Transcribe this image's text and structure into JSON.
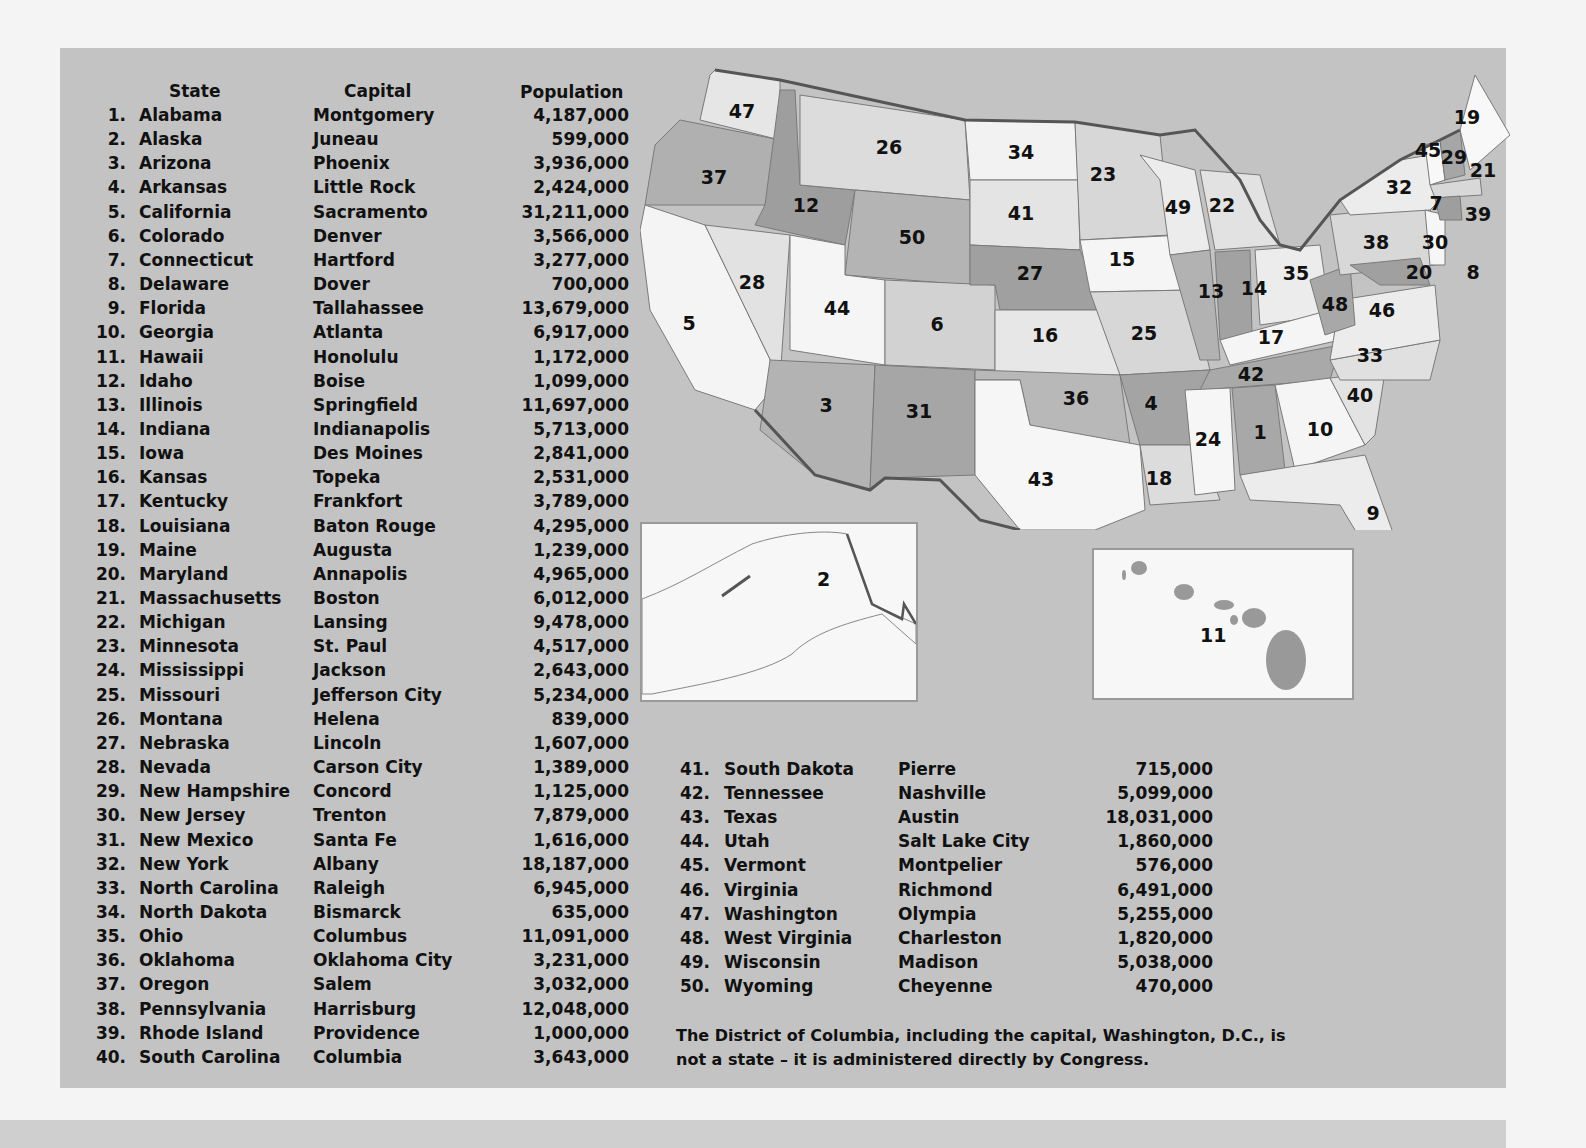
{
  "headers": {
    "state": "State",
    "capital": "Capital",
    "population": "Population"
  },
  "states": [
    {
      "n": "1.",
      "state": "Alabama",
      "capital": "Montgomery",
      "pop": "4,187,000"
    },
    {
      "n": "2.",
      "state": "Alaska",
      "capital": "Juneau",
      "pop": "599,000"
    },
    {
      "n": "3.",
      "state": "Arizona",
      "capital": "Phoenix",
      "pop": "3,936,000"
    },
    {
      "n": "4.",
      "state": "Arkansas",
      "capital": "Little Rock",
      "pop": "2,424,000"
    },
    {
      "n": "5.",
      "state": "California",
      "capital": "Sacramento",
      "pop": "31,211,000"
    },
    {
      "n": "6.",
      "state": "Colorado",
      "capital": "Denver",
      "pop": "3,566,000"
    },
    {
      "n": "7.",
      "state": "Connecticut",
      "capital": "Hartford",
      "pop": "3,277,000"
    },
    {
      "n": "8.",
      "state": "Delaware",
      "capital": "Dover",
      "pop": "700,000"
    },
    {
      "n": "9.",
      "state": "Florida",
      "capital": "Tallahassee",
      "pop": "13,679,000"
    },
    {
      "n": "10.",
      "state": "Georgia",
      "capital": "Atlanta",
      "pop": "6,917,000"
    },
    {
      "n": "11.",
      "state": "Hawaii",
      "capital": "Honolulu",
      "pop": "1,172,000"
    },
    {
      "n": "12.",
      "state": "Idaho",
      "capital": "Boise",
      "pop": "1,099,000"
    },
    {
      "n": "13.",
      "state": "Illinois",
      "capital": "Springfield",
      "pop": "11,697,000"
    },
    {
      "n": "14.",
      "state": "Indiana",
      "capital": "Indianapolis",
      "pop": "5,713,000"
    },
    {
      "n": "15.",
      "state": "Iowa",
      "capital": "Des Moines",
      "pop": "2,841,000"
    },
    {
      "n": "16.",
      "state": "Kansas",
      "capital": "Topeka",
      "pop": "2,531,000"
    },
    {
      "n": "17.",
      "state": "Kentucky",
      "capital": "Frankfort",
      "pop": "3,789,000"
    },
    {
      "n": "18.",
      "state": "Louisiana",
      "capital": "Baton Rouge",
      "pop": "4,295,000"
    },
    {
      "n": "19.",
      "state": "Maine",
      "capital": "Augusta",
      "pop": "1,239,000"
    },
    {
      "n": "20.",
      "state": "Maryland",
      "capital": "Annapolis",
      "pop": "4,965,000"
    },
    {
      "n": "21.",
      "state": "Massachusetts",
      "capital": "Boston",
      "pop": "6,012,000"
    },
    {
      "n": "22.",
      "state": "Michigan",
      "capital": "Lansing",
      "pop": "9,478,000"
    },
    {
      "n": "23.",
      "state": "Minnesota",
      "capital": "St. Paul",
      "pop": "4,517,000"
    },
    {
      "n": "24.",
      "state": "Mississippi",
      "capital": "Jackson",
      "pop": "2,643,000"
    },
    {
      "n": "25.",
      "state": "Missouri",
      "capital": "Jefferson City",
      "pop": "5,234,000"
    },
    {
      "n": "26.",
      "state": "Montana",
      "capital": "Helena",
      "pop": "839,000"
    },
    {
      "n": "27.",
      "state": "Nebraska",
      "capital": "Lincoln",
      "pop": "1,607,000"
    },
    {
      "n": "28.",
      "state": "Nevada",
      "capital": "Carson City",
      "pop": "1,389,000"
    },
    {
      "n": "29.",
      "state": "New Hampshire",
      "capital": "Concord",
      "pop": "1,125,000"
    },
    {
      "n": "30.",
      "state": "New Jersey",
      "capital": "Trenton",
      "pop": "7,879,000"
    },
    {
      "n": "31.",
      "state": "New Mexico",
      "capital": "Santa Fe",
      "pop": "1,616,000"
    },
    {
      "n": "32.",
      "state": "New York",
      "capital": "Albany",
      "pop": "18,187,000"
    },
    {
      "n": "33.",
      "state": "North Carolina",
      "capital": "Raleigh",
      "pop": "6,945,000"
    },
    {
      "n": "34.",
      "state": "North Dakota",
      "capital": "Bismarck",
      "pop": "635,000"
    },
    {
      "n": "35.",
      "state": "Ohio",
      "capital": "Columbus",
      "pop": "11,091,000"
    },
    {
      "n": "36.",
      "state": "Oklahoma",
      "capital": "Oklahoma City",
      "pop": "3,231,000"
    },
    {
      "n": "37.",
      "state": "Oregon",
      "capital": "Salem",
      "pop": "3,032,000"
    },
    {
      "n": "38.",
      "state": "Pennsylvania",
      "capital": "Harrisburg",
      "pop": "12,048,000"
    },
    {
      "n": "39.",
      "state": "Rhode Island",
      "capital": "Providence",
      "pop": "1,000,000"
    },
    {
      "n": "40.",
      "state": "South Carolina",
      "capital": "Columbia",
      "pop": "3,643,000"
    },
    {
      "n": "41.",
      "state": "South Dakota",
      "capital": "Pierre",
      "pop": "715,000"
    },
    {
      "n": "42.",
      "state": "Tennessee",
      "capital": "Nashville",
      "pop": "5,099,000"
    },
    {
      "n": "43.",
      "state": "Texas",
      "capital": "Austin",
      "pop": "18,031,000"
    },
    {
      "n": "44.",
      "state": "Utah",
      "capital": "Salt Lake City",
      "pop": "1,860,000"
    },
    {
      "n": "45.",
      "state": "Vermont",
      "capital": "Montpelier",
      "pop": "576,000"
    },
    {
      "n": "46.",
      "state": "Virginia",
      "capital": "Richmond",
      "pop": "6,491,000"
    },
    {
      "n": "47.",
      "state": "Washington",
      "capital": "Olympia",
      "pop": "5,255,000"
    },
    {
      "n": "48.",
      "state": "West Virginia",
      "capital": "Charleston",
      "pop": "1,820,000"
    },
    {
      "n": "49.",
      "state": "Wisconsin",
      "capital": "Madison",
      "pop": "5,038,000"
    },
    {
      "n": "50.",
      "state": "Wyoming",
      "capital": "Cheyenne",
      "pop": "470,000"
    }
  ],
  "note": "The District of Columbia, including the capital, Washington, D.C., is not a state – it is administered directly by Congress.",
  "map": {
    "colors": {
      "light": "#f4f4f4",
      "mid": "#d9d9d9",
      "dark": "#a8a8a8",
      "border": "#555555"
    },
    "labels": [
      {
        "id": "47",
        "x": 102,
        "y": 58
      },
      {
        "id": "37",
        "x": 74,
        "y": 124
      },
      {
        "id": "12",
        "x": 166,
        "y": 152
      },
      {
        "id": "26",
        "x": 249,
        "y": 94
      },
      {
        "id": "34",
        "x": 381,
        "y": 99
      },
      {
        "id": "23",
        "x": 463,
        "y": 121
      },
      {
        "id": "41",
        "x": 381,
        "y": 160
      },
      {
        "id": "50",
        "x": 272,
        "y": 184
      },
      {
        "id": "27",
        "x": 390,
        "y": 220
      },
      {
        "id": "5",
        "x": 49,
        "y": 270
      },
      {
        "id": "28",
        "x": 112,
        "y": 229
      },
      {
        "id": "44",
        "x": 197,
        "y": 255
      },
      {
        "id": "6",
        "x": 297,
        "y": 271
      },
      {
        "id": "16",
        "x": 405,
        "y": 282
      },
      {
        "id": "15",
        "x": 482,
        "y": 206
      },
      {
        "id": "49",
        "x": 538,
        "y": 154
      },
      {
        "id": "22",
        "x": 582,
        "y": 152
      },
      {
        "id": "13",
        "x": 571,
        "y": 238
      },
      {
        "id": "14",
        "x": 614,
        "y": 235
      },
      {
        "id": "35",
        "x": 656,
        "y": 220
      },
      {
        "id": "25",
        "x": 504,
        "y": 280
      },
      {
        "id": "17",
        "x": 631,
        "y": 284
      },
      {
        "id": "42",
        "x": 611,
        "y": 321
      },
      {
        "id": "36",
        "x": 436,
        "y": 345
      },
      {
        "id": "4",
        "x": 511,
        "y": 350
      },
      {
        "id": "3",
        "x": 186,
        "y": 352
      },
      {
        "id": "31",
        "x": 279,
        "y": 358
      },
      {
        "id": "43",
        "x": 401,
        "y": 426
      },
      {
        "id": "18",
        "x": 519,
        "y": 425
      },
      {
        "id": "24",
        "x": 568,
        "y": 386
      },
      {
        "id": "1",
        "x": 620,
        "y": 379
      },
      {
        "id": "10",
        "x": 680,
        "y": 376
      },
      {
        "id": "40",
        "x": 720,
        "y": 342
      },
      {
        "id": "33",
        "x": 730,
        "y": 302
      },
      {
        "id": "9",
        "x": 733,
        "y": 460
      },
      {
        "id": "48",
        "x": 695,
        "y": 251
      },
      {
        "id": "46",
        "x": 742,
        "y": 257
      },
      {
        "id": "38",
        "x": 736,
        "y": 189
      },
      {
        "id": "32",
        "x": 759,
        "y": 134
      },
      {
        "id": "20",
        "x": 779,
        "y": 219
      },
      {
        "id": "8",
        "x": 833,
        "y": 219
      },
      {
        "id": "30",
        "x": 795,
        "y": 189
      },
      {
        "id": "7",
        "x": 796,
        "y": 150
      },
      {
        "id": "39",
        "x": 838,
        "y": 161
      },
      {
        "id": "21",
        "x": 843,
        "y": 117
      },
      {
        "id": "29",
        "x": 814,
        "y": 104
      },
      {
        "id": "45",
        "x": 788,
        "y": 97
      },
      {
        "id": "19",
        "x": 827,
        "y": 64
      }
    ],
    "inset_alaska": {
      "label": "2"
    },
    "inset_hawaii": {
      "label": "11"
    }
  }
}
